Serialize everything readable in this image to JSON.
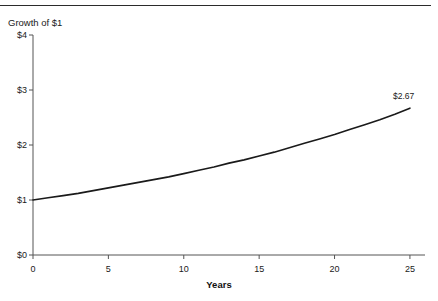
{
  "figure": {
    "width": 438,
    "height": 301,
    "background": "#ffffff",
    "has_top_rule": true
  },
  "chart_data": {
    "type": "line",
    "title": "",
    "ylabel": "Growth of $1",
    "xlabel": "Years",
    "xlim": [
      0,
      26
    ],
    "ylim": [
      0,
      4
    ],
    "grid": false,
    "legend": null,
    "line_color": "#1a1a1a",
    "x_tick_labels": [
      "0",
      "5",
      "10",
      "15",
      "20",
      "25"
    ],
    "x_ticks": [
      0,
      5,
      10,
      15,
      20,
      25
    ],
    "y_tick_labels": [
      "$0",
      "$1",
      "$2",
      "$3",
      "$4"
    ],
    "y_ticks": [
      0,
      1,
      2,
      3,
      4
    ],
    "annotations": [
      {
        "text": "$2.67",
        "x": 25,
        "y": 2.67
      }
    ],
    "series": [
      {
        "name": "Growth of $1",
        "x": [
          0,
          1,
          2,
          3,
          4,
          5,
          6,
          7,
          8,
          9,
          10,
          11,
          12,
          13,
          14,
          15,
          16,
          17,
          18,
          19,
          20,
          21,
          22,
          23,
          24,
          25
        ],
        "values": [
          1.0,
          1.04,
          1.08,
          1.12,
          1.17,
          1.22,
          1.27,
          1.32,
          1.37,
          1.42,
          1.48,
          1.54,
          1.6,
          1.67,
          1.73,
          1.8,
          1.87,
          1.95,
          2.03,
          2.11,
          2.19,
          2.28,
          2.37,
          2.46,
          2.56,
          2.67
        ]
      }
    ]
  }
}
